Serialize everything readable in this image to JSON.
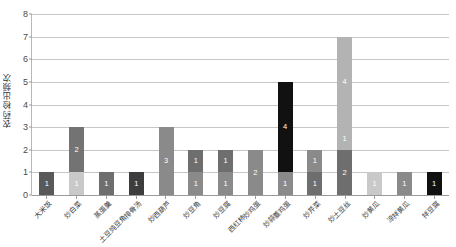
{
  "chart_data": {
    "type": "bar",
    "subtype": "stacked-bar",
    "title": "",
    "xlabel": "",
    "ylabel": "农药检出频次",
    "ylim": [
      0,
      8
    ],
    "ytick_values": [
      0,
      1,
      2,
      3,
      4,
      5,
      6,
      7,
      8
    ],
    "ytick_labels": [
      "0",
      "1",
      "2",
      "3",
      "4",
      "5",
      "6",
      "7",
      "8"
    ],
    "grid": true,
    "legend": "none",
    "categories": [
      "大米饭",
      "炒白菜",
      "蒸蛋羹",
      "土豆炖豆角排骨汤",
      "炒西葫芦",
      "炒豆角",
      "炒豆腐",
      "西红柿炒鸡蛋",
      "炒蒜薹鸡蛋",
      "炒芹菜",
      "炒土豆丝",
      "炒黄瓜",
      "凉拌黄瓜",
      "拌豆腐"
    ],
    "totals": [
      1,
      3,
      1,
      1,
      3,
      2,
      2,
      2,
      5,
      2,
      7,
      1,
      1,
      1
    ],
    "series": [
      {
        "name": "segment-1",
        "values": [
          1,
          1,
          1,
          1,
          3,
          1,
          1,
          2,
          1,
          1,
          2,
          1,
          1,
          1
        ],
        "colors": [
          "#595959",
          "#c9c9c9",
          "#6e6e6e",
          "#3d3d3d",
          "#8a8a8a",
          "#8a8a8a",
          "#8a8a8a",
          "#8a8a8a",
          "#8a8a8a",
          "#6e6e6e",
          "#6e6e6e",
          "#c9c9c9",
          "#8a8a8a",
          "#111111"
        ],
        "labels": [
          "1",
          "1",
          "1",
          "1",
          "3",
          "1",
          "1",
          "2",
          "1",
          "1",
          "2",
          "1",
          "1",
          "1"
        ]
      },
      {
        "name": "segment-2",
        "values": [
          0,
          2,
          0,
          0,
          0,
          1,
          1,
          0,
          4,
          1,
          1,
          0,
          0,
          0
        ],
        "colors": [
          "",
          "#737373",
          "",
          "",
          "",
          "#6e6e6e",
          "#6e6e6e",
          "",
          "#111111",
          "#8a8a8a",
          "#b3b3b3",
          "",
          "",
          ""
        ],
        "labels": [
          "",
          "2",
          "",
          "",
          "",
          "1",
          "1",
          "",
          "4",
          "1",
          "1",
          "",
          "",
          ""
        ]
      },
      {
        "name": "segment-3",
        "values": [
          0,
          0,
          0,
          0,
          0,
          0,
          0,
          0,
          0,
          0,
          4,
          0,
          0,
          0
        ],
        "colors": [
          "",
          "",
          "",
          "",
          "",
          "",
          "",
          "",
          "",
          "",
          "#b3b3b3",
          "",
          "",
          ""
        ],
        "labels": [
          "",
          "",
          "",
          "",
          "",
          "",
          "",
          "",
          "",
          "",
          "4",
          "",
          "",
          ""
        ]
      }
    ]
  },
  "colors": {
    "background": "#ffffff",
    "gridline": "#c6c6c6",
    "axis": "#9a9a9a",
    "tick_text": "#4a4a4a",
    "label_text": "#3a3a3a"
  }
}
